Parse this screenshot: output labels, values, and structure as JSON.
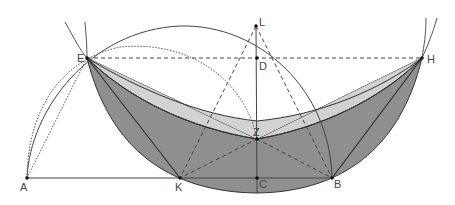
{
  "diagram": {
    "type": "geometric-construction",
    "colors": {
      "dark_fill": "#8f8f8f",
      "light_fill": "#d2d2d2",
      "stroke": "#333333",
      "label": "#444444",
      "background": "#ffffff"
    },
    "points": [
      {
        "label": "A",
        "x": 27,
        "y": 178
      },
      {
        "label": "K",
        "x": 180,
        "y": 178
      },
      {
        "label": "C",
        "x": 257,
        "y": 178
      },
      {
        "label": "B",
        "x": 332,
        "y": 178
      },
      {
        "label": "E",
        "x": 87,
        "y": 58
      },
      {
        "label": "D",
        "x": 257,
        "y": 58
      },
      {
        "label": "H",
        "x": 422,
        "y": 58
      },
      {
        "label": "L",
        "x": 256,
        "y": 26
      },
      {
        "label": "Z",
        "x": 257,
        "y": 139
      }
    ],
    "labels": {
      "A": "A",
      "K": "K",
      "C": "C",
      "B": "B",
      "E": "E",
      "D": "D",
      "H": "H",
      "L": "L",
      "Z": "Z"
    }
  }
}
